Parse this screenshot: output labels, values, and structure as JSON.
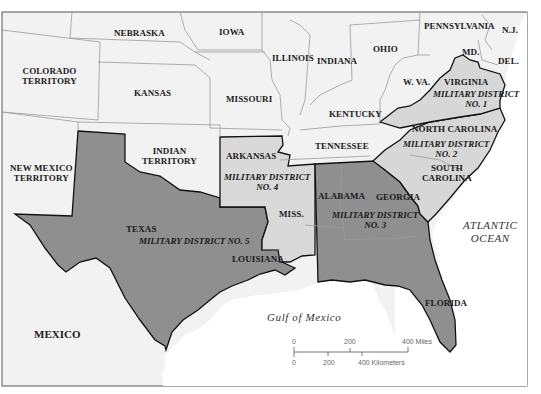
{
  "map": {
    "title": "Military Reconstruction Districts",
    "colors": {
      "background": "#f2f2f2",
      "union_state": "#ececec",
      "district_light": "#d7d7d7",
      "district_dark": "#8f8f8f",
      "water": "#ffffff",
      "border": "#999999",
      "district_border": "#111111"
    },
    "states": {
      "nebraska": "NEBRASKA",
      "iowa": "IOWA",
      "colorado_line1": "COLORADO",
      "colorado_line2": "TERRITORY",
      "kansas": "KANSAS",
      "missouri": "MISSOURI",
      "illinois": "ILLINOIS",
      "indiana": "INDIANA",
      "ohio": "OHIO",
      "pennsylvania": "PENNSYLVANIA",
      "nj": "N.J.",
      "md": "MD.",
      "del": "DEL.",
      "wva": "W. VA.",
      "virginia": "VIRGINIA",
      "kentucky": "KENTUCKY",
      "north_carolina": "NORTH CAROLINA",
      "tennessee": "TENNESSEE",
      "south_carolina_line1": "SOUTH",
      "south_carolina_line2": "CAROLINA",
      "indian_line1": "INDIAN",
      "indian_line2": "TERRITORY",
      "arkansas": "ARKANSAS",
      "new_mexico_line1": "NEW MEXICO",
      "new_mexico_line2": "TERRITORY",
      "texas": "TEXAS",
      "louisiana": "LOUISIANA",
      "miss": "MISS.",
      "alabama": "ALABAMA",
      "georgia": "GEORGIA",
      "florida": "FLORIDA",
      "mexico": "MEXICO"
    },
    "districts": {
      "d1_line1": "MILITARY DISTRICT",
      "d1_line2": "NO. 1",
      "d2_line1": "MILITARY DISTRICT",
      "d2_line2": "NO. 2",
      "d3_line1": "MILITARY DISTRICT",
      "d3_line2": "NO. 3",
      "d4_line1": "MILITARY DISTRICT",
      "d4_line2": "NO. 4",
      "d5": "MILITARY DISTRICT NO. 5"
    },
    "water": {
      "atlantic_line1": "ATLANTIC",
      "atlantic_line2": "OCEAN",
      "gulf": "Gulf of Mexico"
    },
    "scale": {
      "miles_0": "0",
      "miles_200": "200",
      "miles_400": "400 Miles",
      "km_0": "0",
      "km_200": "200",
      "km_400": "400 Kilometers"
    }
  }
}
